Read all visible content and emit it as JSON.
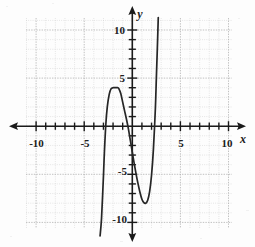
{
  "figure": {
    "kind": "cartesian-graph",
    "background_color": "#fdfdfd",
    "curve_color": "#262626",
    "axis_color": "#1a1a1a",
    "grid_color": "#c9c9c9"
  },
  "axes": {
    "x_label": "x",
    "y_label": "y",
    "x_tick_labels": [
      "-10",
      "-5",
      "5",
      "10"
    ],
    "y_tick_labels": [
      "10",
      "5",
      "-5",
      "-10"
    ]
  },
  "chart_data": {
    "type": "line",
    "title": "",
    "xlabel": "x",
    "ylabel": "y",
    "xlim": [
      -11.5,
      11.5
    ],
    "ylim": [
      -11.5,
      11.5
    ],
    "grid": true,
    "legend": "none",
    "x_ticks": [
      -10,
      -9,
      -8,
      -7,
      -6,
      -5,
      -4,
      -3,
      -2,
      -1,
      1,
      2,
      3,
      4,
      5,
      6,
      7,
      8,
      9,
      10
    ],
    "y_ticks": [
      -10,
      -9,
      -8,
      -7,
      -6,
      -5,
      -4,
      -3,
      -2,
      -1,
      1,
      2,
      3,
      4,
      5,
      6,
      7,
      8,
      9,
      10
    ],
    "x_labeled_ticks": [
      -10,
      -5,
      5,
      10
    ],
    "y_labeled_ticks": [
      -10,
      -5,
      5,
      10
    ],
    "series": [
      {
        "name": "cubic-curve",
        "roots": [
          -2.9,
          -0.4,
          2.3
        ],
        "local_maximum": [
          -1.5,
          4.0
        ],
        "local_minimum": [
          1.3,
          -8.0
        ],
        "x": [
          -3.35,
          -3.2,
          -3.0,
          -2.9,
          -2.75,
          -2.6,
          -2.4,
          -2.2,
          -2.0,
          -1.8,
          -1.6,
          -1.5,
          -1.4,
          -1.2,
          -1.0,
          -0.8,
          -0.6,
          -0.4,
          -0.2,
          0.0,
          0.2,
          0.4,
          0.6,
          0.8,
          1.0,
          1.2,
          1.4,
          1.6,
          1.8,
          2.0,
          2.2,
          2.4,
          2.5,
          2.6,
          2.7
        ],
        "y": [
          -11.4,
          -9.6,
          -5.2,
          -2.7,
          0.2,
          2.0,
          3.3,
          3.9,
          4.0,
          4.0,
          4.0,
          4.0,
          3.9,
          3.4,
          2.5,
          1.6,
          0.7,
          -0.3,
          -1.5,
          -2.7,
          -3.9,
          -5.0,
          -6.0,
          -6.9,
          -7.6,
          -7.95,
          -8.0,
          -7.7,
          -6.8,
          -5.1,
          -2.3,
          1.9,
          5.0,
          8.0,
          11.3
        ]
      }
    ]
  }
}
